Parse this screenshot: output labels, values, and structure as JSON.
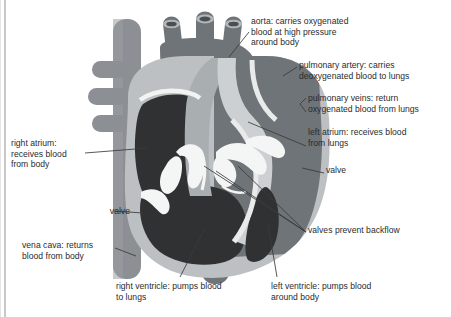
{
  "page": {
    "clipped_top_text": "",
    "background_color": "#ffffff",
    "rule_color": "#9b9b9b"
  },
  "diagram": {
    "type": "labelled anatomical diagram",
    "palette": {
      "outline_muscle": "#b9bcbd",
      "deoxygenated_chamber": "#2f3133",
      "oxygenated_chamber": "#6f7478",
      "vessel_mid": "#8c9094",
      "vessel_light": "#a9aeb1",
      "valve_white": "#f2f3f3",
      "leader_line": "#3a3a3a"
    },
    "labels": [
      {
        "id": "aorta",
        "text": "aorta: carries oxygenated\nblood at high pressure\naround body"
      },
      {
        "id": "pulmonary-artery",
        "text": "pulmonary artery: carries\ndeoxygenated blood to lungs"
      },
      {
        "id": "pulmonary-veins",
        "text": "pulmonary veins: return\noxygenated blood from lungs"
      },
      {
        "id": "left-atrium",
        "text": "left atrium: receives blood\nfrom lungs"
      },
      {
        "id": "valve-right",
        "text": "valve"
      },
      {
        "id": "right-atrium",
        "text": "right atrium:\nreceives blood\nfrom body"
      },
      {
        "id": "valve-left",
        "text": "valve"
      },
      {
        "id": "vena-cava",
        "text": "vena cava: returns\nblood from body"
      },
      {
        "id": "valves-backflow",
        "text": "valves prevent backflow"
      },
      {
        "id": "right-ventricle",
        "text": "right ventricle: pumps blood\nto lungs"
      },
      {
        "id": "left-ventricle",
        "text": "left ventricle: pumps blood\naround body"
      }
    ]
  }
}
